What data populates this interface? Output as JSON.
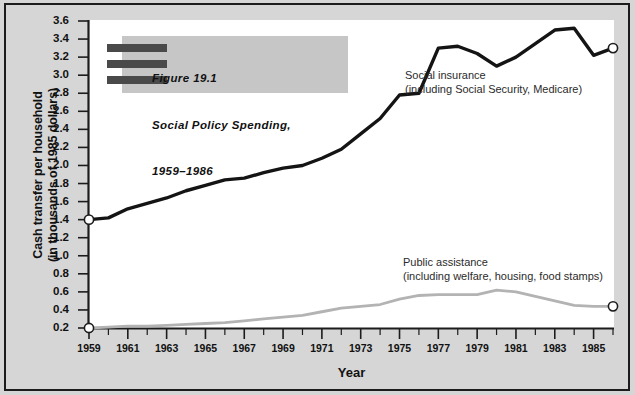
{
  "figure": {
    "title_lines": "Figure 19.1\nSocial Policy Spending,\n1959–1986",
    "title_line1": "Figure 19.1",
    "title_line2": "Social Policy Spending,",
    "title_line3": "1959–1986"
  },
  "axes": {
    "y_title": "Cash transfer per household\n(in thousands of 1985 dollars)",
    "y_title_line1": "Cash transfer per household",
    "y_title_line2": "(in thousands of 1985 dollars)",
    "x_title": "Year"
  },
  "labels": {
    "social_insurance": "Social insurance\n(including Social Security, Medicare)",
    "public_assistance": "Public assistance\n(including welfare, housing, food stamps)"
  },
  "colors": {
    "background": "#d6d6d6",
    "plot_background": "#ffffff",
    "border": "#1c1c1c",
    "social_insurance_line": "#141414",
    "public_assistance_line": "#b3b3b3",
    "title_box": "#c6c6c6",
    "title_bars": "#4a4a4a",
    "marker_fill": "#ffffff"
  },
  "chart_data": {
    "type": "line",
    "xlabel": "Year",
    "ylabel": "Cash transfer per household (in thousands of 1985 dollars)",
    "xlim": [
      1959,
      1986
    ],
    "ylim": [
      0.2,
      3.6
    ],
    "ytick_labels": [
      "3.6",
      "3.4",
      "3.2",
      "3.0",
      "2.8",
      "2.6",
      "2.4",
      "2.2",
      "2.0",
      "1.8",
      "1.6",
      "1.4",
      "1.2",
      "1.0",
      "0.8",
      "0.6",
      "0.4",
      "0.2"
    ],
    "ytick_values": [
      3.6,
      3.4,
      3.2,
      3.0,
      2.8,
      2.6,
      2.4,
      2.2,
      2.0,
      1.8,
      1.6,
      1.4,
      1.2,
      1.0,
      0.8,
      0.6,
      0.4,
      0.2
    ],
    "xtick_labels": [
      "1959",
      "1961",
      "1963",
      "1965",
      "1967",
      "1969",
      "1971",
      "1973",
      "1975",
      "1977",
      "1979",
      "1981",
      "1983",
      "1985"
    ],
    "xtick_values": [
      1959,
      1961,
      1963,
      1965,
      1967,
      1969,
      1971,
      1973,
      1975,
      1977,
      1979,
      1981,
      1983,
      1985
    ],
    "minor_xticks_every": 1,
    "grid": false,
    "legend_position": "inline-annotations",
    "x": [
      1959,
      1960,
      1961,
      1962,
      1963,
      1964,
      1965,
      1966,
      1967,
      1968,
      1969,
      1970,
      1971,
      1972,
      1973,
      1974,
      1975,
      1976,
      1977,
      1978,
      1979,
      1980,
      1981,
      1982,
      1983,
      1984,
      1985,
      1986
    ],
    "series": [
      {
        "name": "Social insurance (including Social Security, Medicare)",
        "color": "#141414",
        "endpoint_markers": true,
        "values": [
          1.4,
          1.42,
          1.52,
          1.58,
          1.64,
          1.72,
          1.78,
          1.84,
          1.86,
          1.92,
          1.97,
          2.0,
          2.08,
          2.18,
          2.35,
          2.52,
          2.78,
          2.8,
          3.3,
          3.32,
          3.24,
          3.1,
          3.2,
          3.35,
          3.5,
          3.52,
          3.22,
          3.3
        ]
      },
      {
        "name": "Public assistance (including welfare, housing, food stamps)",
        "color": "#b3b3b3",
        "endpoint_markers": true,
        "values": [
          0.2,
          0.21,
          0.22,
          0.22,
          0.23,
          0.24,
          0.25,
          0.26,
          0.28,
          0.3,
          0.32,
          0.34,
          0.38,
          0.42,
          0.44,
          0.46,
          0.52,
          0.56,
          0.57,
          0.57,
          0.57,
          0.62,
          0.6,
          0.55,
          0.5,
          0.45,
          0.44,
          0.44
        ]
      }
    ]
  }
}
